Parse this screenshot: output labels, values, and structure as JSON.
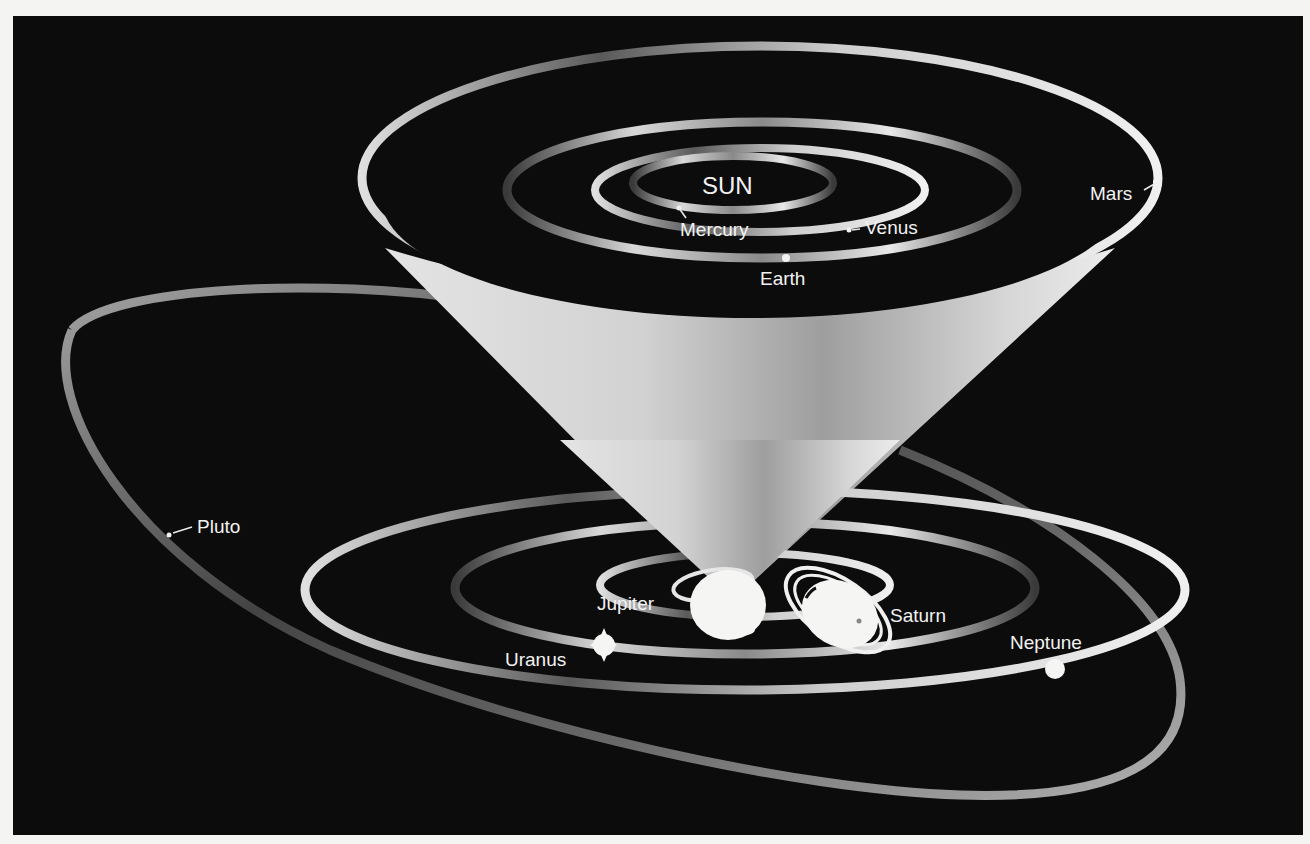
{
  "diagram": {
    "type": "solar-system-orbits",
    "colors": {
      "background": "#0c0c0c",
      "page": "#f4f4f2",
      "ribbon_light": "#e6e6e6",
      "ribbon_dark": "#4a4a4a",
      "cone": "#cfcfcf",
      "planet": "#f5f5f3",
      "text": "#f2f2f2"
    },
    "center_label": "SUN",
    "inner_planets": [
      {
        "name": "Mercury",
        "label": "Mercury"
      },
      {
        "name": "Venus",
        "label": "Venus"
      },
      {
        "name": "Earth",
        "label": "Earth"
      },
      {
        "name": "Mars",
        "label": "Mars"
      }
    ],
    "outer_planets": [
      {
        "name": "Jupiter",
        "label": "Jupiter"
      },
      {
        "name": "Saturn",
        "label": "Saturn"
      },
      {
        "name": "Uranus",
        "label": "Uranus"
      },
      {
        "name": "Neptune",
        "label": "Neptune"
      },
      {
        "name": "Pluto",
        "label": "Pluto"
      }
    ]
  }
}
